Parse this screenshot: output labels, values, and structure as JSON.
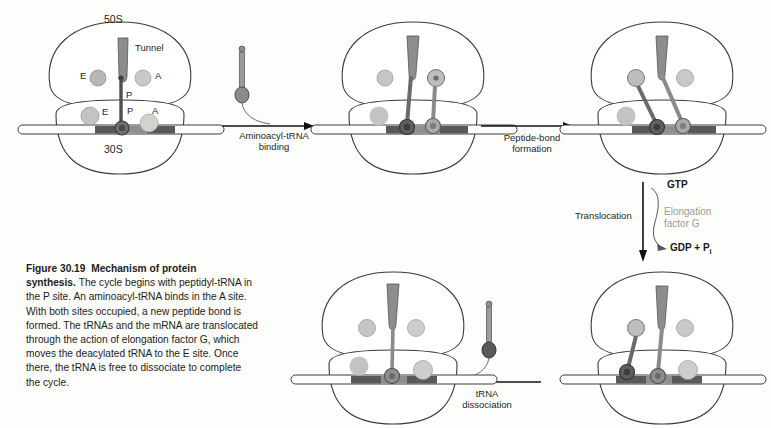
{
  "figure": {
    "number": "Figure 30.19",
    "title": "Mechanism of protein synthesis.",
    "caption_body": "The cycle begins with peptidyl-tRNA in the P site. An aminoacyl-tRNA binds in the A site. With both sites occupied, a new peptide bond is formed. The tRNAs and the mRNA are translocated through the action of elongation factor G, which moves the deacylated tRNA to the E site. Once there, the tRNA is free to dissociate to complete the cycle."
  },
  "panels": {
    "p1": {
      "name": "initial-peptidyl-tRNA-in-P-site",
      "large_subunit_label": "50S",
      "small_subunit_label": "30S",
      "tunnel_label": "Tunnel",
      "sites_large": {
        "e": "E",
        "a": "A",
        "p": "P"
      },
      "sites_small": {
        "e": "E",
        "p": "P",
        "a": "A"
      }
    },
    "p2": {
      "name": "aminoacyl-tRNA-bound-in-A-site"
    },
    "p3": {
      "name": "peptide-bond-formed"
    },
    "p4": {
      "name": "post-translocation"
    },
    "p5": {
      "name": "after-tRNA-dissociation"
    }
  },
  "arrows": {
    "a1": {
      "line1": "Aminoacyl-tRNA",
      "line2": "binding"
    },
    "a2": {
      "line1": "Peptide-bond",
      "line2": "formation"
    },
    "a3": {
      "label": "Translocation",
      "cofactor_line1": "Elongation",
      "cofactor_line2": "factor G",
      "substrate": "GTP",
      "product": "GDP + P",
      "product_sub": "i"
    },
    "a4": {
      "line1": "tRNA",
      "line2": "dissociation"
    }
  },
  "colors": {
    "outline": "#3a3a3a",
    "tunnel_fill": "#8d8d8d",
    "trna_dark": "#4f4f4f",
    "trna_mid": "#8a8a8a",
    "site_circle_light": "#c9c9c7",
    "site_circle_mid": "#b0b0ae",
    "mrna_fill": "#ffffff",
    "codon_dark": "#59595b",
    "codon_mid": "#8f8f91",
    "efg_text": "#9a9a96"
  }
}
